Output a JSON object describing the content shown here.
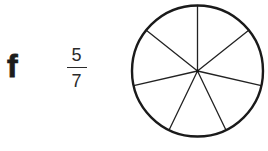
{
  "exercise": {
    "item_label": "f",
    "fraction": {
      "numerator": "5",
      "denominator": "7"
    },
    "diagram": {
      "shape": "circle",
      "sectors": 7,
      "shaded_sectors": 0,
      "rim_color": "#1a1a1a",
      "spoke_color": "#222222"
    }
  }
}
